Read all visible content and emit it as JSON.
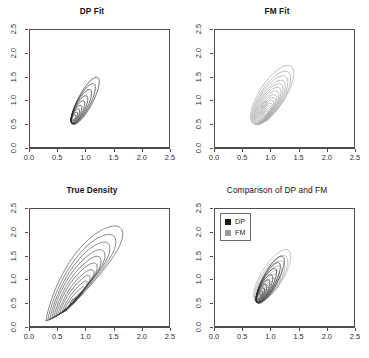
{
  "figure": {
    "caption": ""
  },
  "axes": {
    "xticks": [
      "0.0",
      "0.5",
      "1.0",
      "1.5",
      "2.0",
      "2.5"
    ],
    "yticks": [
      "0.0",
      "0.5",
      "1.0",
      "1.5",
      "2.0",
      "2.5"
    ],
    "xlim": [
      0.0,
      2.5
    ],
    "ylim": [
      0.0,
      2.5
    ]
  },
  "panels": {
    "dp": {
      "title": "DP Fit"
    },
    "fm": {
      "title": "FM Fit"
    },
    "true": {
      "title": "True Density"
    },
    "cmp": {
      "title": "Comparison of DP and FM"
    }
  },
  "legend": {
    "items": [
      {
        "label": "DP",
        "color": "#1a1a1a"
      },
      {
        "label": "FM",
        "color": "#9a9a9a"
      }
    ]
  },
  "colors": {
    "dp_contour": "#2a2a2a",
    "fm_contour": "#a0a0a0",
    "true_contour": "#3a3a3a",
    "frame": "#4d4d4d",
    "background": "#ffffff"
  },
  "chart_data": {
    "type": "contour",
    "xlabel": "",
    "ylabel": "",
    "xlim": [
      0.0,
      2.5
    ],
    "ylim": [
      0.0,
      2.5
    ],
    "grid": false,
    "legend_position": "top-left (comparison panel only)",
    "panels": [
      {
        "name": "DP Fit",
        "series": [
          {
            "name": "DP",
            "color": "#2a2a2a",
            "n_levels": 9,
            "mode": [
              0.8,
              0.72
            ],
            "shape": "elongated ellipse tilted ~60 degrees, positively correlated",
            "outer_extent_x": [
              0.45,
              1.45
            ],
            "outer_extent_y": [
              0.28,
              1.78
            ]
          }
        ]
      },
      {
        "name": "FM Fit",
        "series": [
          {
            "name": "FM",
            "color": "#a0a0a0",
            "n_levels": 14,
            "mode": [
              0.95,
              0.72
            ],
            "secondary_mode": [
              0.88,
              1.02
            ],
            "shape": "broad elongated ellipse tilted ~55 degrees, bimodal core",
            "outer_extent_x": [
              0.4,
              1.55
            ],
            "outer_extent_y": [
              0.25,
              2.05
            ]
          }
        ]
      },
      {
        "name": "True Density",
        "series": [
          {
            "name": "True",
            "color": "#3a3a3a",
            "n_levels": 12,
            "mode": [
              0.68,
              0.47
            ],
            "shape": "curved skewed teardrop / banana, heavy tail toward upper right",
            "outer_extent_x": [
              0.25,
              1.68
            ],
            "outer_extent_y": [
              0.05,
              2.15
            ]
          }
        ]
      },
      {
        "name": "Comparison of DP and FM",
        "series": [
          {
            "name": "DP",
            "color": "#2a2a2a",
            "n_levels": 9,
            "mode": [
              0.8,
              0.72
            ],
            "shape": "elongated ellipse tilted ~60 degrees"
          },
          {
            "name": "FM",
            "color": "#a0a0a0",
            "n_levels": 12,
            "mode": [
              0.92,
              0.78
            ],
            "shape": "elongated ellipse tilted ~55 degrees, overlaid"
          }
        ]
      }
    ]
  }
}
